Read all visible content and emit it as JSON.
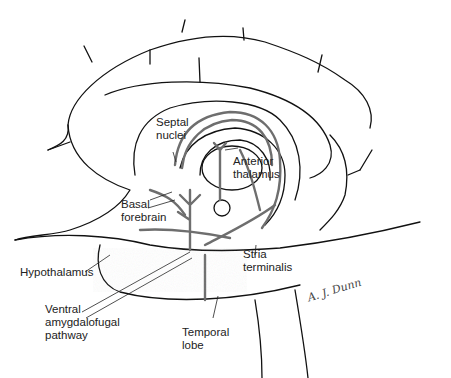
{
  "figure": {
    "type": "anatomical-illustration",
    "colors": {
      "outline": "#111111",
      "pathway": "#6e6e6e",
      "stipple": "#9a9a9a",
      "background": "#ffffff"
    }
  },
  "labels": {
    "septal_nuclei": {
      "line1": "Septal",
      "line2": "nuclei"
    },
    "anterior_thalamus": {
      "line1": "Anterior",
      "line2": "thalamus"
    },
    "basal_forebrain": {
      "line1": "Basal",
      "line2": "forebrain"
    },
    "stria_terminalis": {
      "line1": "Stria",
      "line2": "terminalis"
    },
    "hypothalamus": {
      "line1": "Hypothalamus"
    },
    "ventral_amygdalofugal": {
      "line1": "Ventral",
      "line2": "amygdalofugal",
      "line3": "pathway"
    },
    "temporal_lobe": {
      "line1": "Temporal",
      "line2": "lobe"
    }
  },
  "signature": "A. J. Dunn"
}
